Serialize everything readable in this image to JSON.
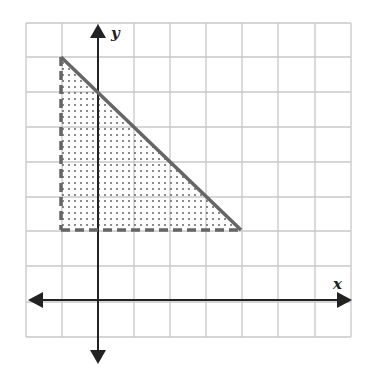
{
  "graph": {
    "x_axis_label": "x",
    "y_axis_label": "y",
    "grid": {
      "columns": 9,
      "rows": 9,
      "origin_col": 2,
      "origin_row_from_top": 8
    },
    "region": {
      "description": "Shaded triangular region of a system of inequalities",
      "vertices": [
        [
          -1,
          7
        ],
        [
          -1,
          2
        ],
        [
          4,
          2
        ]
      ],
      "boundaries": [
        {
          "equation": "y = -x + 6",
          "style": "solid"
        },
        {
          "equation": "x = -1",
          "style": "dashed"
        },
        {
          "equation": "y = 2",
          "style": "dashed"
        }
      ],
      "fill": "dotted"
    },
    "colors": {
      "grid": "#c8c8c8",
      "axis": "#222222",
      "boundary": "#666666",
      "dots": "#555555"
    }
  }
}
